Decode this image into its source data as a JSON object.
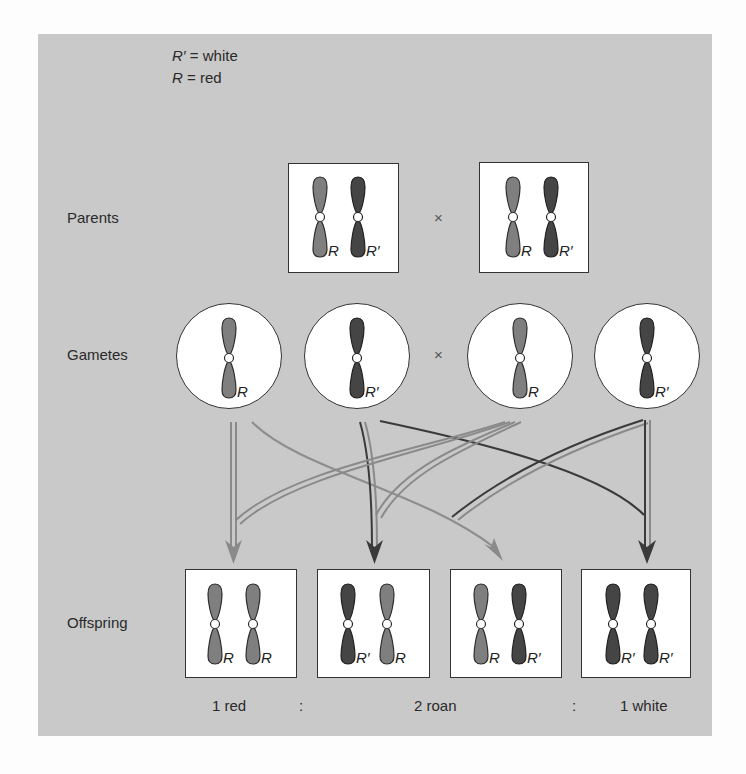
{
  "legend": {
    "line1": {
      "symbol": "R′",
      "text": " = white"
    },
    "line2": {
      "symbol": "R",
      "text": " = red"
    }
  },
  "rows": {
    "parents": "Parents",
    "gametes": "Gametes",
    "offspring": "Offspring"
  },
  "cross_symbol": "×",
  "colors": {
    "panel": "#c9c9c9",
    "red_allele": "#7f7f7f",
    "white_allele": "#454545",
    "outline": "#333333"
  },
  "parents": [
    {
      "alleles": [
        "R",
        "R′"
      ]
    },
    {
      "alleles": [
        "R",
        "R′"
      ]
    }
  ],
  "gametes": [
    {
      "allele": "R"
    },
    {
      "allele": "R′"
    },
    {
      "allele": "R"
    },
    {
      "allele": "R′"
    }
  ],
  "offspring": [
    {
      "alleles": [
        "R",
        "R"
      ]
    },
    {
      "alleles": [
        "R′",
        "R"
      ]
    },
    {
      "alleles": [
        "R",
        "R′"
      ]
    },
    {
      "alleles": [
        "R′",
        "R′"
      ]
    }
  ],
  "ratio": {
    "red": "1 red",
    "sep1": ":",
    "roan": "2 roan",
    "sep2": ":",
    "white": "1 white"
  }
}
